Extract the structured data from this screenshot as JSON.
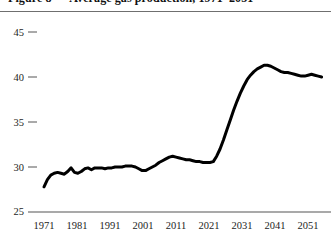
{
  "chart_data": {
    "type": "line",
    "title": "Figure 8 — Average gas production, 1971–2051",
    "xlabel": "",
    "ylabel": "",
    "xlim": [
      1971,
      2054
    ],
    "ylim": [
      25,
      45
    ],
    "grid": false,
    "legend": null,
    "legend_position": "none",
    "line_color": "#000000",
    "line_width": 3,
    "xticks": [
      1971,
      1981,
      1991,
      2001,
      2011,
      2021,
      2031,
      2041,
      2051
    ],
    "xtick_labels": [
      "1971",
      "1981",
      "1991",
      "2001",
      "2011",
      "2021",
      "2031",
      "2041",
      "2051"
    ],
    "yticks": [
      25,
      30,
      35,
      40,
      45
    ],
    "ytick_labels": [
      "25",
      "30",
      "35",
      "40",
      "45"
    ],
    "series": [
      {
        "name": "value",
        "x": [
          1971,
          1972,
          1973,
          1974,
          1975,
          1976,
          1977,
          1978,
          1979,
          1980,
          1981,
          1982,
          1983,
          1984,
          1985,
          1986,
          1987,
          1988,
          1989,
          1990,
          1991,
          1992,
          1993,
          1994,
          1995,
          1996,
          1997,
          1998,
          1999,
          2000,
          2001,
          2002,
          2003,
          2004,
          2005,
          2006,
          2007,
          2008,
          2009,
          2010,
          2011,
          2012,
          2013,
          2014,
          2015,
          2016,
          2017,
          2018,
          2019,
          2020,
          2021,
          2022,
          2023,
          2024,
          2025,
          2026,
          2027,
          2028,
          2029,
          2030,
          2031,
          2032,
          2033,
          2034,
          2035,
          2036,
          2037,
          2038,
          2039,
          2040,
          2041,
          2042,
          2043,
          2044,
          2045,
          2046,
          2047,
          2048,
          2049,
          2050,
          2051,
          2052,
          2053
        ],
        "y": [
          27.8,
          28.6,
          29.1,
          29.3,
          29.4,
          29.3,
          29.2,
          29.5,
          29.9,
          29.4,
          29.3,
          29.5,
          29.8,
          29.9,
          29.7,
          29.9,
          29.9,
          29.9,
          29.8,
          29.9,
          29.9,
          30.0,
          30.0,
          30.0,
          30.1,
          30.1,
          30.1,
          30.0,
          29.8,
          29.6,
          29.6,
          29.8,
          30.0,
          30.2,
          30.5,
          30.7,
          30.9,
          31.1,
          31.2,
          31.1,
          31.0,
          30.9,
          30.8,
          30.8,
          30.7,
          30.6,
          30.6,
          30.5,
          30.5,
          30.5,
          30.6,
          31.2,
          32.0,
          33.0,
          34.1,
          35.2,
          36.3,
          37.3,
          38.2,
          39.0,
          39.7,
          40.2,
          40.6,
          40.9,
          41.1,
          41.3,
          41.3,
          41.2,
          41.0,
          40.8,
          40.6,
          40.5,
          40.5,
          40.4,
          40.3,
          40.2,
          40.1,
          40.1,
          40.2,
          40.3,
          40.2,
          40.1,
          40.0
        ]
      }
    ]
  },
  "axis": {
    "ytick_labels": [
      "45",
      "40",
      "35",
      "30",
      "25"
    ],
    "xtick_labels": [
      "1971",
      "1981",
      "1991",
      "2001",
      "2011",
      "2021",
      "2031",
      "2041",
      "2051"
    ]
  }
}
